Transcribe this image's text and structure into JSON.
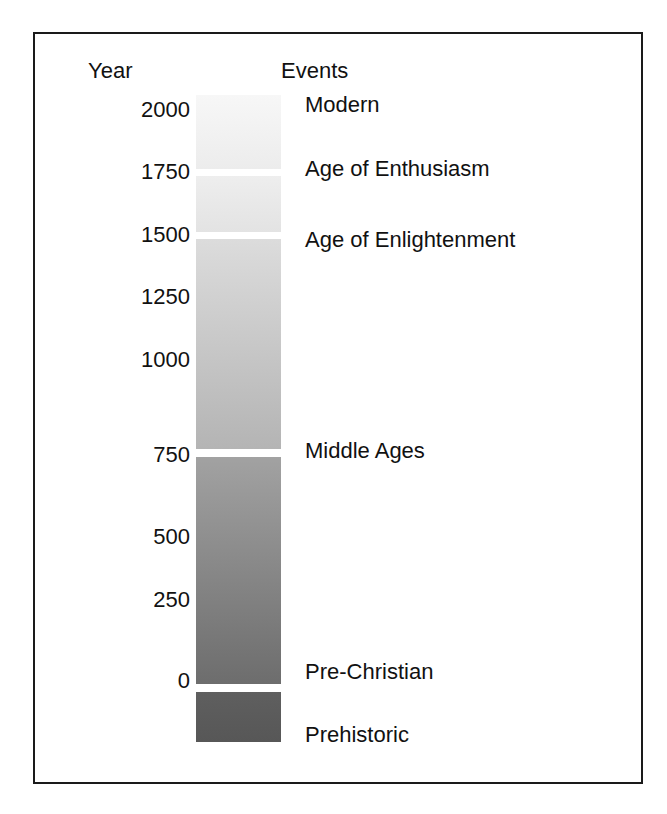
{
  "figure": {
    "background": "#ffffff",
    "frame_color": "#1a1a1a"
  },
  "headers": {
    "year": "Year",
    "events": "Events"
  },
  "chart_data": {
    "type": "bar",
    "title": "",
    "subtitle": "",
    "xlabel": "Events",
    "ylabel": "Year",
    "orientation": "vertical",
    "grid": false,
    "legend": false,
    "axis": {
      "name": "Year",
      "range": [
        -250,
        2100
      ],
      "tick_labels": [
        "2000",
        "1750",
        "1500",
        "1250",
        "1000",
        "750",
        "500",
        "250",
        "0"
      ],
      "tick_values": [
        2000,
        1750,
        1500,
        1250,
        1000,
        750,
        500,
        250,
        0
      ],
      "tick_y_px": [
        110,
        172,
        235,
        297,
        360,
        455,
        537,
        600,
        681
      ]
    },
    "categories": [
      "Modern",
      "Age of Enthusiasm",
      "Age of Enlightenment",
      "Middle Ages",
      "Pre-Christian",
      "Prehistoric"
    ],
    "segments": [
      {
        "label": "Modern",
        "year_start": 1750,
        "year_end": 2100,
        "top_px": 95,
        "height_px": 74,
        "color_top": "#f7f7f7",
        "color_bottom": "#ececec",
        "label_y_px": 105
      },
      {
        "label": "Age of Enthusiasm",
        "year_start": 1500,
        "year_end": 1750,
        "top_px": 175,
        "height_px": 57,
        "color_top": "#eeeeee",
        "color_bottom": "#e3e3e3",
        "label_y_px": 169
      },
      {
        "label": "Age of Enlightenment",
        "year_start": 750,
        "year_end": 1500,
        "top_px": 238,
        "height_px": 211,
        "color_top": "#dcdcdc",
        "color_bottom": "#b4b4b4",
        "label_y_px": 240
      },
      {
        "label": "Middle Ages",
        "year_start": 0,
        "year_end": 750,
        "top_px": 456,
        "height_px": 228,
        "color_top": "#a2a2a2",
        "color_bottom": "#6d6d6d",
        "label_y_px": 451
      },
      {
        "label": "Pre-Christian",
        "year_start": -250,
        "year_end": 0,
        "top_px": 691,
        "height_px": 51,
        "color_top": "#5f5f5f",
        "color_bottom": "#575757",
        "label_y_px": 672
      },
      {
        "label": "Prehistoric",
        "year_start": null,
        "year_end": -250,
        "top_px": null,
        "height_px": null,
        "color_top": null,
        "color_bottom": null,
        "label_y_px": 735
      }
    ],
    "separators_y_px": [
      172,
      235,
      453,
      688
    ],
    "colorbar": {
      "x_px": 196,
      "width_px": 85,
      "top_px": 95,
      "bottom_px": 742,
      "color_light": "#f7f7f7",
      "color_dark": "#575757"
    }
  }
}
